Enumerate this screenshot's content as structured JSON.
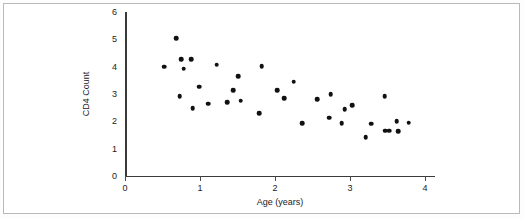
{
  "chart_data": {
    "type": "scatter",
    "title": "",
    "xlabel": "Age (years)",
    "ylabel": "CD4 Count",
    "xlim": [
      0,
      4.13
    ],
    "ylim": [
      0,
      6
    ],
    "xticks": [
      0,
      1,
      2,
      3,
      4
    ],
    "xtick_labels": [
      "0",
      "1",
      "2",
      "3",
      "4"
    ],
    "yticks": [
      0,
      1,
      2,
      3,
      4,
      5,
      6
    ],
    "ytick_labels": [
      "0",
      "1",
      "2",
      "3",
      "4",
      "5",
      "6"
    ],
    "grid": false,
    "legend": false,
    "marker": "filled-circle",
    "marker_color": "#111111",
    "points": [
      {
        "x": 0.52,
        "y": 4.0
      },
      {
        "x": 0.68,
        "y": 5.05
      },
      {
        "x": 0.75,
        "y": 4.28
      },
      {
        "x": 0.78,
        "y": 3.93
      },
      {
        "x": 0.73,
        "y": 2.93
      },
      {
        "x": 0.88,
        "y": 4.28
      },
      {
        "x": 0.9,
        "y": 2.47
      },
      {
        "x": 0.99,
        "y": 3.27
      },
      {
        "x": 1.11,
        "y": 2.64
      },
      {
        "x": 1.22,
        "y": 4.07
      },
      {
        "x": 1.36,
        "y": 2.69
      },
      {
        "x": 1.44,
        "y": 3.15
      },
      {
        "x": 1.51,
        "y": 3.65
      },
      {
        "x": 1.54,
        "y": 2.76
      },
      {
        "x": 1.79,
        "y": 2.3
      },
      {
        "x": 1.82,
        "y": 4.02
      },
      {
        "x": 2.03,
        "y": 3.15
      },
      {
        "x": 2.12,
        "y": 2.85
      },
      {
        "x": 2.25,
        "y": 3.45
      },
      {
        "x": 2.36,
        "y": 1.94
      },
      {
        "x": 2.56,
        "y": 2.8
      },
      {
        "x": 2.72,
        "y": 2.13
      },
      {
        "x": 2.74,
        "y": 3.0
      },
      {
        "x": 2.89,
        "y": 1.93
      },
      {
        "x": 2.93,
        "y": 2.45
      },
      {
        "x": 3.03,
        "y": 2.6
      },
      {
        "x": 3.21,
        "y": 1.43
      },
      {
        "x": 3.28,
        "y": 1.92
      },
      {
        "x": 3.46,
        "y": 2.93
      },
      {
        "x": 3.47,
        "y": 1.65
      },
      {
        "x": 3.52,
        "y": 1.66
      },
      {
        "x": 3.62,
        "y": 2.0
      },
      {
        "x": 3.64,
        "y": 1.63
      },
      {
        "x": 3.78,
        "y": 1.95
      }
    ]
  }
}
